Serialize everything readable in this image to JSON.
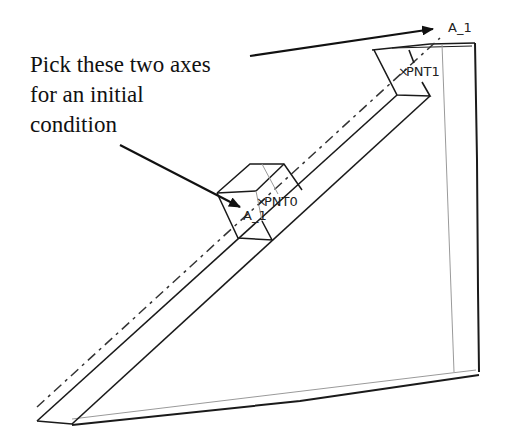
{
  "annotation": {
    "lines": [
      "Pick these two axes",
      "for an initial",
      "condition"
    ]
  },
  "labels": {
    "axis_top": "A_1",
    "axis_lower": "A_1",
    "point_top": "PNT1",
    "point_lower": "PNT0",
    "point_marker": "×"
  },
  "colors": {
    "stroke": "#1a1a1a",
    "hidden": "#9a9a9a",
    "background": "#ffffff"
  }
}
